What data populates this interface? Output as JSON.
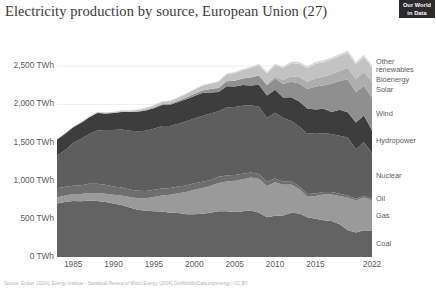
{
  "header": {
    "title": "Electricity production by source, European Union (27)",
    "logo_line1": "Our World",
    "logo_line2": "in Data"
  },
  "footer": {
    "text": "Source: Ember (2024); Energy Institute - Statistical Review of World Energy (2024)   OurWorldInData.org/energy | CC BY"
  },
  "axis": {
    "y_labels": [
      "2,500 TWh",
      "2,000 TWh",
      "1,500 TWh",
      "1,000 TWh",
      "500 TWh",
      "0 TWh"
    ],
    "x_labels": [
      "1985",
      "1990",
      "1995",
      "2000",
      "2005",
      "2010",
      "2015",
      "2022"
    ]
  },
  "legend": {
    "items": [
      {
        "label": "Other\nrenewables",
        "color": "#d8d8d8"
      },
      {
        "label": "Bioenergy",
        "color": "#c2c2c2"
      },
      {
        "label": "Solar",
        "color": "#adadad"
      },
      {
        "label": "Wind",
        "color": "#8f8f8f"
      },
      {
        "label": "Hydropower",
        "color": "#3d3d3d"
      },
      {
        "label": "Nuclear",
        "color": "#5e5e5e"
      },
      {
        "label": "Oil",
        "color": "#6e6e6e"
      },
      {
        "label": "Gas",
        "color": "#9a9a9a"
      },
      {
        "label": "Coal",
        "color": "#636363"
      }
    ]
  },
  "chart_data": {
    "type": "area",
    "stacked": true,
    "title": "Electricity production by source, European Union (27)",
    "xlabel": "",
    "ylabel": "TWh",
    "ylim": [
      0,
      3000
    ],
    "xlim": [
      1983,
      2022
    ],
    "grid": true,
    "legend_position": "right",
    "unit": "TWh",
    "x": [
      1983,
      1984,
      1985,
      1986,
      1987,
      1988,
      1989,
      1990,
      1991,
      1992,
      1993,
      1994,
      1995,
      1996,
      1997,
      1998,
      1999,
      2000,
      2001,
      2002,
      2003,
      2004,
      2005,
      2006,
      2007,
      2008,
      2009,
      2010,
      2011,
      2012,
      2013,
      2014,
      2015,
      2016,
      2017,
      2018,
      2019,
      2020,
      2021,
      2022
    ],
    "series": [
      {
        "name": "Coal",
        "color": "#636363",
        "values": [
          700,
          720,
          735,
          730,
          740,
          735,
          720,
          700,
          680,
          650,
          620,
          605,
          600,
          595,
          580,
          575,
          560,
          560,
          565,
          580,
          600,
          600,
          590,
          600,
          610,
          580,
          520,
          540,
          545,
          580,
          570,
          520,
          500,
          480,
          470,
          430,
          350,
          320,
          350,
          340
        ]
      },
      {
        "name": "Gas",
        "color": "#9a9a9a",
        "values": [
          80,
          85,
          90,
          95,
          100,
          105,
          110,
          115,
          125,
          135,
          150,
          165,
          185,
          210,
          235,
          260,
          290,
          320,
          340,
          350,
          370,
          390,
          410,
          420,
          430,
          445,
          410,
          440,
          400,
          370,
          320,
          270,
          300,
          340,
          350,
          370,
          430,
          420,
          430,
          400
        ]
      },
      {
        "name": "Oil",
        "color": "#6e6e6e",
        "values": [
          120,
          115,
          110,
          115,
          120,
          118,
          115,
          110,
          105,
          100,
          98,
          95,
          95,
          92,
          90,
          90,
          88,
          85,
          82,
          80,
          80,
          78,
          75,
          72,
          68,
          62,
          55,
          50,
          45,
          42,
          38,
          35,
          33,
          32,
          30,
          28,
          26,
          22,
          24,
          22
        ]
      },
      {
        "name": "Nuclear",
        "color": "#5e5e5e",
        "values": [
          430,
          480,
          560,
          610,
          650,
          700,
          720,
          740,
          760,
          770,
          780,
          790,
          800,
          820,
          810,
          820,
          840,
          850,
          860,
          870,
          860,
          890,
          890,
          890,
          880,
          880,
          840,
          860,
          830,
          790,
          780,
          790,
          790,
          770,
          760,
          760,
          760,
          650,
          700,
          600
        ]
      },
      {
        "name": "Hydropower",
        "color": "#3d3d3d",
        "values": [
          210,
          215,
          205,
          210,
          220,
          230,
          215,
          220,
          230,
          245,
          255,
          265,
          270,
          275,
          280,
          285,
          290,
          295,
          300,
          275,
          250,
          280,
          270,
          270,
          260,
          290,
          290,
          300,
          270,
          310,
          330,
          330,
          310,
          320,
          290,
          340,
          330,
          350,
          350,
          300
        ]
      },
      {
        "name": "Wind",
        "color": "#8f8f8f",
        "values": [
          0,
          0,
          0,
          0,
          1,
          1,
          1,
          2,
          3,
          4,
          5,
          6,
          8,
          10,
          13,
          17,
          22,
          28,
          35,
          45,
          55,
          65,
          75,
          85,
          105,
          120,
          135,
          150,
          180,
          205,
          235,
          255,
          300,
          305,
          370,
          380,
          430,
          400,
          390,
          420
        ]
      },
      {
        "name": "Solar",
        "color": "#adadad",
        "values": [
          0,
          0,
          0,
          0,
          0,
          0,
          0,
          0,
          0,
          0,
          0,
          0,
          0,
          0,
          0,
          0,
          0,
          0,
          0,
          1,
          1,
          1,
          2,
          3,
          4,
          8,
          15,
          25,
          48,
          72,
          85,
          95,
          110,
          115,
          125,
          130,
          150,
          165,
          180,
          210
        ]
      },
      {
        "name": "Bioenergy",
        "color": "#c2c2c2",
        "values": [
          5,
          6,
          7,
          8,
          9,
          10,
          11,
          12,
          14,
          16,
          19,
          22,
          26,
          30,
          35,
          40,
          46,
          52,
          60,
          68,
          78,
          88,
          98,
          108,
          118,
          128,
          138,
          148,
          158,
          168,
          175,
          180,
          185,
          190,
          192,
          195,
          198,
          195,
          195,
          190
        ]
      },
      {
        "name": "Other renewables",
        "color": "#d8d8d8",
        "values": [
          2,
          2,
          2,
          3,
          3,
          3,
          4,
          4,
          5,
          5,
          6,
          6,
          7,
          7,
          8,
          8,
          9,
          10,
          11,
          12,
          13,
          14,
          15,
          16,
          17,
          18,
          19,
          20,
          21,
          22,
          23,
          24,
          25,
          26,
          27,
          28,
          29,
          29,
          30,
          30
        ]
      }
    ]
  }
}
